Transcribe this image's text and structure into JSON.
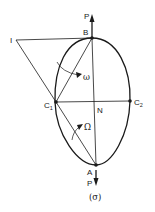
{
  "diagram": {
    "caption": "(σ)",
    "points": {
      "I": {
        "label": "I",
        "x": 16,
        "y": 40
      },
      "B": {
        "label": "B",
        "x": 92,
        "y": 38
      },
      "C1": {
        "label": "C",
        "sub": "1",
        "x": 56,
        "y": 102
      },
      "C2": {
        "label": "C",
        "sub": "2",
        "x": 130,
        "y": 101
      },
      "N": {
        "label": "N",
        "x": 93,
        "y": 104
      },
      "A": {
        "label": "A",
        "x": 96,
        "y": 165
      }
    },
    "forces": {
      "top": {
        "label": "P"
      },
      "bottom": {
        "label": "P"
      }
    },
    "angles": {
      "omega_small": {
        "label": "ω"
      },
      "omega_capital": {
        "label": "Ω"
      }
    },
    "lines": [
      "I-B",
      "I-C1",
      "B-A",
      "C1-C2",
      "C1-B",
      "C1-A"
    ],
    "colors": {
      "ink": "#1a1a1a",
      "background": "#ffffff"
    }
  }
}
